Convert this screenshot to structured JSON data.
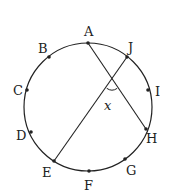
{
  "diagram": {
    "type": "circle-with-chords",
    "circle": {
      "cx": 88,
      "cy": 107,
      "r": 64
    },
    "stroke_color": "#222222",
    "points": [
      {
        "name": "A",
        "x": 88,
        "y": 43,
        "label_x": 84,
        "label_y": 36
      },
      {
        "name": "B",
        "x": 49,
        "y": 57,
        "label_x": 38,
        "label_y": 53
      },
      {
        "name": "C",
        "x": 27,
        "y": 90,
        "label_x": 13,
        "label_y": 95
      },
      {
        "name": "D",
        "x": 31,
        "y": 132,
        "label_x": 16,
        "label_y": 140
      },
      {
        "name": "E",
        "x": 54,
        "y": 161,
        "label_x": 42,
        "label_y": 177
      },
      {
        "name": "F",
        "x": 89,
        "y": 171,
        "label_x": 84,
        "label_y": 190
      },
      {
        "name": "G",
        "x": 125,
        "y": 159,
        "label_x": 126,
        "label_y": 175
      },
      {
        "name": "H",
        "x": 146,
        "y": 129,
        "label_x": 146,
        "label_y": 143
      },
      {
        "name": "I",
        "x": 148,
        "y": 90,
        "label_x": 155,
        "label_y": 96
      },
      {
        "name": "J",
        "x": 127,
        "y": 57,
        "label_x": 128,
        "label_y": 52
      }
    ],
    "chords": [
      {
        "from": "A",
        "to": "H"
      },
      {
        "from": "J",
        "to": "E"
      }
    ],
    "angle": {
      "label": "x",
      "vertex_x": 112,
      "vertex_y": 81,
      "label_x": 104,
      "label_y": 110
    }
  }
}
